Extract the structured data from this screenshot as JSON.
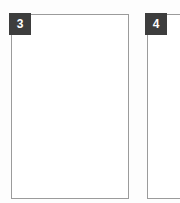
{
  "canvas": {
    "width": 180,
    "height": 203,
    "background_color": "#fdfdfd"
  },
  "style": {
    "panel_fill": "#ffffff",
    "panel_border_color": "#9b9b9b",
    "badge_background": "#3d3d3d",
    "badge_text_color": "#ffffff"
  },
  "regions": [
    {
      "id": "region-3",
      "badge_label": "3",
      "content": "",
      "clipped": false
    },
    {
      "id": "region-4",
      "badge_label": "4",
      "content": "",
      "clipped": true
    }
  ]
}
